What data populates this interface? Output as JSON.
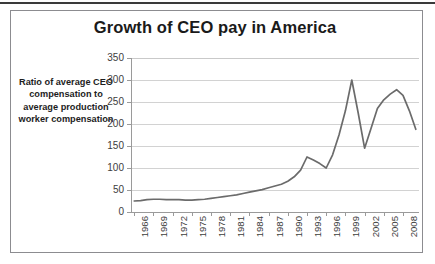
{
  "figure": {
    "title": "Growth of CEO pay in America",
    "y_axis_title": "Ratio of average CEO compensation to average production worker compensation",
    "border_color": "#8c8c90",
    "line_color": "#6b6b6b",
    "grid_color": "#d2d2d2"
  },
  "chart_data": {
    "type": "line",
    "title": "Growth of CEO pay in America",
    "xlabel": "",
    "ylabel": "Ratio of average CEO compensation to average production worker compensation",
    "ylim": [
      0,
      350
    ],
    "yticks": [
      0,
      50,
      100,
      150,
      200,
      250,
      300,
      350
    ],
    "xtick_labels": [
      "1966",
      "1969",
      "1972",
      "1975",
      "1978",
      "1981",
      "1984",
      "1987",
      "1990",
      "1993",
      "1996",
      "1999",
      "2002",
      "2005",
      "2008"
    ],
    "grid": true,
    "legend": false,
    "series": [
      {
        "name": "Ratio of average CEO compensation to average production worker compensation",
        "x": [
          1966,
          1967,
          1968,
          1969,
          1970,
          1971,
          1972,
          1973,
          1974,
          1975,
          1976,
          1977,
          1978,
          1979,
          1980,
          1981,
          1982,
          1983,
          1984,
          1985,
          1986,
          1987,
          1988,
          1989,
          1990,
          1991,
          1992,
          1993,
          1994,
          1995,
          1996,
          1997,
          1998,
          1999,
          2000,
          2001,
          2002,
          2003,
          2004,
          2005,
          2006,
          2007,
          2008,
          2009,
          2010
        ],
        "values": [
          25,
          26,
          28,
          29,
          29,
          28,
          28,
          28,
          27,
          27,
          28,
          29,
          31,
          33,
          35,
          37,
          39,
          42,
          45,
          48,
          51,
          55,
          59,
          63,
          70,
          80,
          95,
          125,
          118,
          110,
          100,
          130,
          175,
          230,
          300,
          225,
          145,
          190,
          235,
          255,
          268,
          278,
          265,
          230,
          188
        ]
      }
    ]
  }
}
